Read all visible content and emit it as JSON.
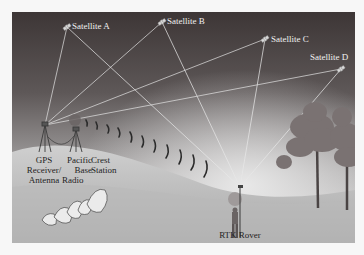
{
  "diagram": {
    "type": "rtk-gps-setup",
    "satellites": [
      {
        "id": "A",
        "label": "Satellite A"
      },
      {
        "id": "B",
        "label": "Satellite B"
      },
      {
        "id": "C",
        "label": "Satellite C"
      },
      {
        "id": "D",
        "label": "Satellite D"
      }
    ],
    "base": {
      "gps_receiver_label_1": "GPS",
      "gps_receiver_label_2": "Receiver/",
      "gps_receiver_label_3": "Antenna",
      "radio_label_1": "Pacific",
      "radio_label_2": "Base",
      "radio_label_3": "Radio",
      "crest_label_1": "Crest",
      "crest_label_2": "Station"
    },
    "rover": {
      "label": "RTK Rover"
    },
    "colors": {
      "sky_top": "#3b3535",
      "sky_bottom": "#c9c9c9",
      "ground": "#bdbdbd",
      "signal_line": "#e6e6e6"
    }
  }
}
